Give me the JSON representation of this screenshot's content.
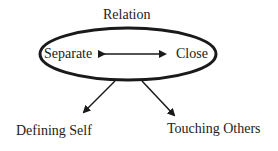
{
  "diagram": {
    "title": "Relation",
    "ellipse_left": "Separate",
    "ellipse_right": "Close",
    "child_left": "Defining Self",
    "child_right": "Touching Others",
    "stroke_color": "#1a1a1a"
  }
}
